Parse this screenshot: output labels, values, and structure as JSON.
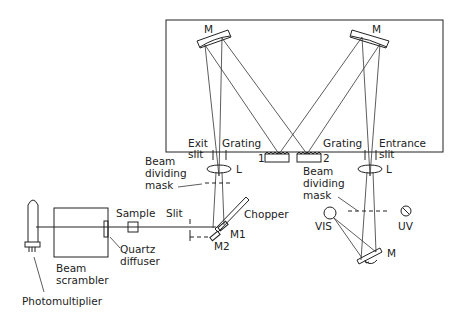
{
  "diagram": {
    "type": "optical-layout",
    "labels": {
      "mirror_left": "M",
      "mirror_right": "M",
      "mirror_bottom": "M",
      "exit_slit_line1": "Exit",
      "exit_slit_line2": "slit",
      "grating1_label": "Grating",
      "grating1_num": "1",
      "grating2_label": "Grating",
      "grating2_num": "2",
      "entrance_slit_line1": "Entrance",
      "entrance_slit_line2": "slit",
      "lens_left": "L",
      "lens_right": "L",
      "mask_left_line1": "Beam",
      "mask_left_line2": "dividing",
      "mask_left_line3": "mask",
      "mask_right_line1": "Beam",
      "mask_right_line2": "dividing",
      "mask_right_line3": "mask",
      "chopper": "Chopper",
      "slit": "Slit",
      "sample": "Sample",
      "m1": "M1",
      "m2": "M2",
      "quartz_line1": "Quartz",
      "quartz_line2": "diffuser",
      "scrambler_line1": "Beam",
      "scrambler_line2": "scrambler",
      "photomultiplier": "Photomultiplier",
      "vis": "VIS",
      "uv": "UV"
    },
    "colors": {
      "line": "#222222",
      "background": "#ffffff"
    }
  }
}
